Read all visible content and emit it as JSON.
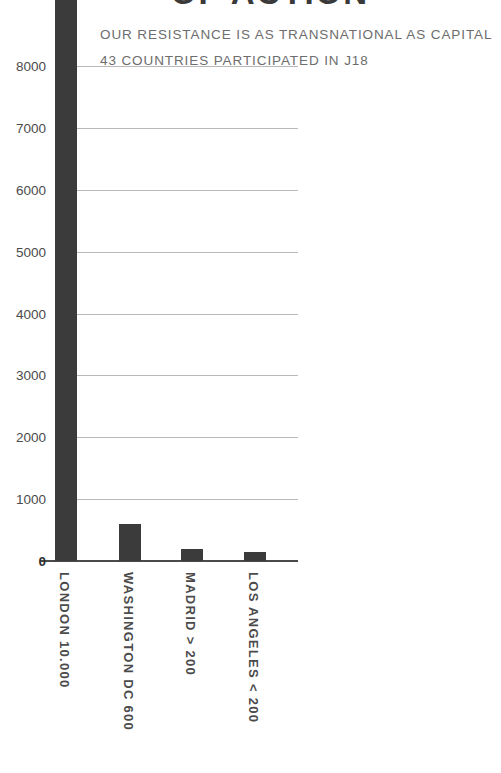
{
  "chart_data": {
    "type": "bar",
    "title": "OF ACTION",
    "subtitle_lines": [
      "OUR RESISTANCE IS AS TRANSNATIONAL AS CAPITAL",
      "43 COUNTRIES PARTICIPATED IN J18"
    ],
    "categories": [
      "LONDON",
      "WASHINGTON DC",
      "MADRID",
      "LOS ANGELES"
    ],
    "category_labels": [
      "LONDON  10.000",
      "WASHINGTON DC    600",
      "MADRID   > 200",
      "LOS ANGELES   < 200"
    ],
    "values": [
      10000,
      600,
      200,
      150
    ],
    "value_annotations": [
      "10.000",
      "600",
      "> 200",
      "< 200"
    ],
    "xlabel": "",
    "ylabel": "",
    "ylim": [
      0,
      8600
    ],
    "yticks": [
      0,
      1000,
      2000,
      3000,
      4000,
      5000,
      6000,
      7000,
      8000
    ],
    "ytick_labels": [
      "0",
      "1000",
      "2000",
      "3000",
      "4000",
      "5000",
      "6000",
      "7000",
      "8000"
    ],
    "grid": true,
    "legend": false,
    "note": "London bar exceeds the plotted axis range and is clipped at the top of the image",
    "colors": {
      "bar": "#3b3b3b",
      "gridline": "#b9b9b9",
      "axis": "#4a4a4a",
      "tick_text": "#4b4b4b",
      "subtitle_text": "#6d6d6d",
      "title_text": "#3a3a3a",
      "background": "#ffffff"
    }
  }
}
